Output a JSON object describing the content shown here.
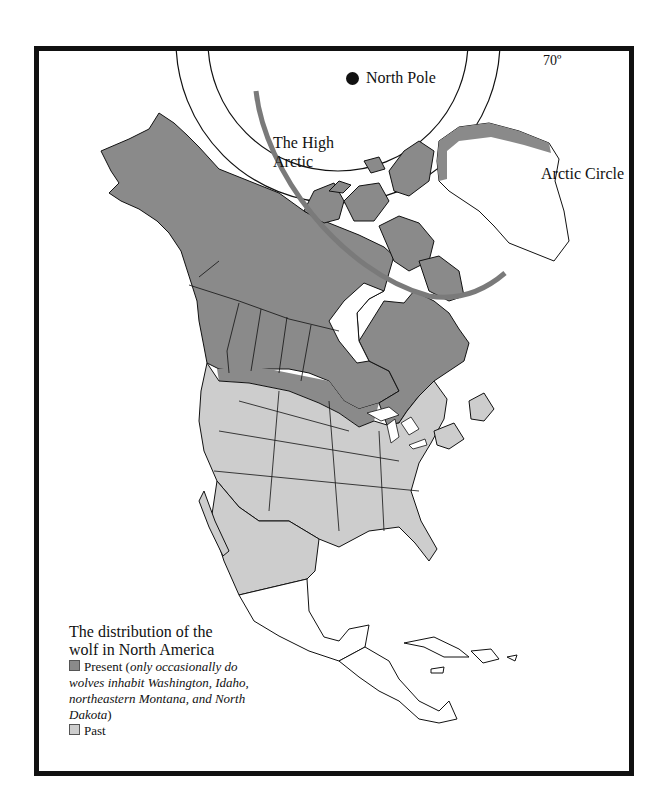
{
  "map": {
    "title": "The distribution of the wolf in North America",
    "labels": {
      "latitude_70": "70º",
      "north_pole": "North Pole",
      "high_arctic": "The High Arctic",
      "arctic_circle": "Arctic Circle"
    },
    "legend": {
      "title_line1": "The distribution of the",
      "title_line2": "wolf in North America",
      "items": [
        {
          "label": "Present",
          "note_open": " (",
          "note": "only occasionally do wolves inhabit Washington, Idaho, northeastern Montana, and North Dakota",
          "note_close": ")",
          "color": "#8a8a8a"
        },
        {
          "label": "Past",
          "color": "#cdcdcd"
        }
      ]
    },
    "colors": {
      "present": "#8a8a8a",
      "past": "#cdcdcd",
      "outline": "#111111",
      "high_arctic_arc": "#7a7a7a",
      "background": "#ffffff"
    },
    "regions": {
      "present": [
        "Alaska",
        "Canada",
        "Canadian Arctic Archipelago",
        "northern Greenland coast",
        "Minnesota",
        "northern Wisconsin",
        "northern Michigan"
      ],
      "past": [
        "contiguous United States",
        "northern Mexico",
        "Newfoundland",
        "Maritime provinces"
      ],
      "none": [
        "southern Mexico",
        "Central America",
        "Caribbean",
        "interior Greenland"
      ]
    }
  }
}
